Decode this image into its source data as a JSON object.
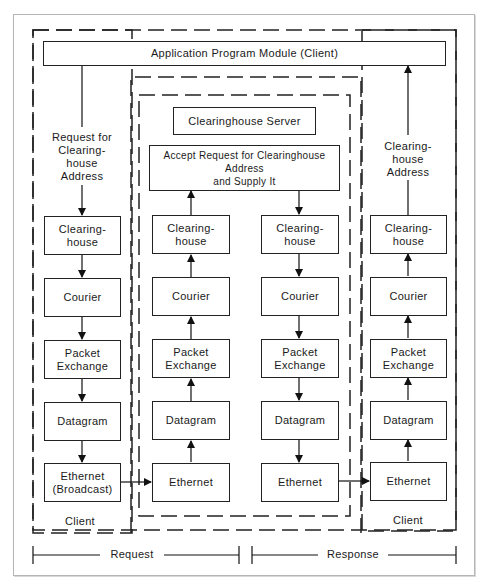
{
  "diagram": {
    "app_module": "Application Program Module (Client)",
    "request_label": "Request for\nClearing-\nhouse\nAddress",
    "response_label": "Clearing-\nhouse\nAddress",
    "server": {
      "title": "Clearinghouse Server",
      "accept": "Accept Request for Clearinghouse Address\nand Supply It"
    },
    "layers": {
      "clearinghouse": "Clearing-\nhouse",
      "courier": "Courier",
      "packet_exchange": "Packet\nExchange",
      "datagram": "Datagram",
      "ethernet": "Ethernet",
      "ethernet_broadcast": "Ethernet\n(Broadcast)"
    },
    "client_left_label": "Client",
    "client_right_label": "Client",
    "timeline": {
      "request": "Request",
      "response": "Response"
    }
  }
}
